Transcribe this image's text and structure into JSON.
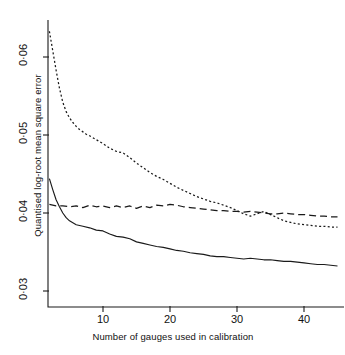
{
  "chart_data": {
    "type": "line",
    "title": "",
    "xlabel": "Number of gauges used in calibration",
    "ylabel": "Quantised log-root mean square error",
    "xlim": [
      1.7,
      45.5
    ],
    "ylim": [
      0.0279,
      0.0635
    ],
    "xticks": [
      10,
      20,
      30,
      40
    ],
    "xtick_labels": [
      "10",
      "20",
      "30",
      "40"
    ],
    "yticks": [
      0.03,
      0.04,
      0.05,
      0.06
    ],
    "ytick_labels": [
      "0·03",
      "0·04",
      "0·05",
      "0·06"
    ],
    "grid": false,
    "legend": "none",
    "axis_color": "#1a1a1a",
    "series": [
      {
        "name": "dotted",
        "style": "dotted",
        "color": "#1a1a1a",
        "x": [
          2,
          2.5,
          3,
          3.5,
          4,
          4.5,
          5,
          5.5,
          6,
          6.5,
          7,
          7.5,
          8,
          9,
          10,
          11,
          12,
          13,
          14,
          15,
          16,
          17,
          18,
          19,
          20,
          21,
          22,
          23,
          24,
          25,
          26,
          27,
          28,
          29,
          30,
          31,
          32,
          33,
          34,
          35,
          36,
          37,
          38,
          39,
          40,
          41,
          42,
          43,
          44,
          45
        ],
        "y": [
          0.0633,
          0.0608,
          0.0583,
          0.056,
          0.0542,
          0.053,
          0.0522,
          0.0516,
          0.0511,
          0.0507,
          0.0504,
          0.0501,
          0.0499,
          0.0494,
          0.0489,
          0.0483,
          0.0479,
          0.0477,
          0.0471,
          0.0464,
          0.0458,
          0.0452,
          0.0447,
          0.0443,
          0.0438,
          0.0433,
          0.0429,
          0.0425,
          0.0421,
          0.0418,
          0.0415,
          0.0413,
          0.041,
          0.0407,
          0.0403,
          0.0399,
          0.0396,
          0.0399,
          0.0402,
          0.0398,
          0.0394,
          0.039,
          0.0388,
          0.0386,
          0.0385,
          0.0384,
          0.0383,
          0.0383,
          0.0382,
          0.0382
        ]
      },
      {
        "name": "dashed",
        "style": "dashed",
        "color": "#1a1a1a",
        "x": [
          2,
          3,
          4,
          5,
          6,
          7,
          8,
          9,
          10,
          11,
          12,
          13,
          14,
          15,
          16,
          17,
          18,
          19,
          20,
          21,
          22,
          23,
          24,
          25,
          26,
          27,
          28,
          29,
          30,
          31,
          32,
          33,
          34,
          35,
          36,
          37,
          38,
          39,
          40,
          41,
          42,
          43,
          44,
          45
        ],
        "y": [
          0.0411,
          0.0409,
          0.0409,
          0.0408,
          0.0409,
          0.0407,
          0.041,
          0.0408,
          0.0409,
          0.0407,
          0.0409,
          0.0407,
          0.0409,
          0.0406,
          0.0409,
          0.0407,
          0.041,
          0.0409,
          0.0411,
          0.041,
          0.0408,
          0.0407,
          0.0406,
          0.0405,
          0.0404,
          0.0403,
          0.0403,
          0.0402,
          0.0402,
          0.0401,
          0.0402,
          0.0401,
          0.04,
          0.0399,
          0.0399,
          0.04,
          0.0399,
          0.0398,
          0.0398,
          0.0397,
          0.0396,
          0.0396,
          0.0395,
          0.0395
        ]
      },
      {
        "name": "solid",
        "style": "solid",
        "color": "#1a1a1a",
        "x": [
          2,
          2.5,
          3,
          3.5,
          4,
          4.5,
          5,
          6,
          7,
          8,
          9,
          10,
          11,
          12,
          13,
          14,
          15,
          16,
          17,
          18,
          19,
          20,
          21,
          22,
          23,
          24,
          25,
          26,
          27,
          28,
          29,
          30,
          31,
          32,
          33,
          34,
          35,
          36,
          37,
          38,
          39,
          40,
          41,
          42,
          43,
          44,
          45
        ],
        "y": [
          0.0444,
          0.043,
          0.0417,
          0.0408,
          0.04,
          0.0394,
          0.039,
          0.0385,
          0.0383,
          0.0381,
          0.0378,
          0.0377,
          0.0373,
          0.037,
          0.0369,
          0.0367,
          0.0363,
          0.0361,
          0.0359,
          0.0357,
          0.0356,
          0.0354,
          0.0352,
          0.0351,
          0.0349,
          0.0348,
          0.0347,
          0.0345,
          0.0344,
          0.0344,
          0.0343,
          0.0342,
          0.0341,
          0.0342,
          0.0341,
          0.034,
          0.034,
          0.0339,
          0.0338,
          0.0338,
          0.0337,
          0.0336,
          0.0335,
          0.0334,
          0.0334,
          0.0333,
          0.0332
        ]
      }
    ]
  }
}
